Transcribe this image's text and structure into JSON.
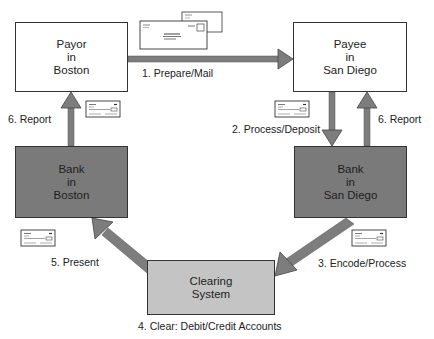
{
  "nodes": {
    "payor": {
      "lines": [
        "Payor",
        "in",
        "Boston"
      ]
    },
    "payee": {
      "lines": [
        "Payee",
        "in",
        "San Diego"
      ]
    },
    "bank_boston": {
      "lines": [
        "Bank",
        "in",
        "Boston"
      ]
    },
    "bank_san_diego": {
      "lines": [
        "Bank",
        "in",
        "San Diego"
      ]
    },
    "clearing": {
      "lines": [
        "Clearing",
        "System"
      ]
    }
  },
  "steps": {
    "step1": "1. Prepare/Mail",
    "step2": "2. Process/Deposit",
    "step3": "3. Encode/Process",
    "step4": "4. Clear: Debit/Credit Accounts",
    "step5": "5. Present",
    "step6_left": "6. Report",
    "step6_right": "6. Report"
  },
  "colors": {
    "arrow": "#7d7d7d",
    "dark_box": "#7a7a7a",
    "light_box": "#c4c4c4",
    "border": "#333333"
  },
  "icons": [
    "envelope-icon",
    "check-icon"
  ]
}
